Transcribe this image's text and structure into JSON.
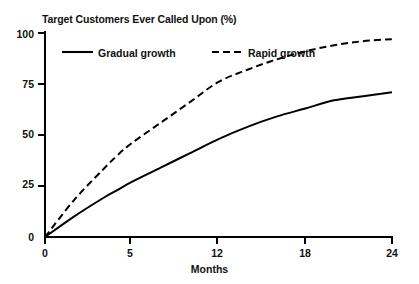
{
  "chart_data": {
    "type": "line",
    "title": "Target Customers Ever Called Upon (%)",
    "xlabel": "Months",
    "ylabel": "",
    "xlim": [
      0,
      24
    ],
    "ylim": [
      0,
      100
    ],
    "grid": false,
    "legend_position": "upper-left-inside",
    "xticks": [
      0,
      5,
      12,
      18,
      24
    ],
    "xtick_labels": [
      "0",
      "5",
      "12",
      "18",
      "24"
    ],
    "yticks": [
      0,
      25,
      50,
      75,
      100
    ],
    "ytick_labels": [
      "0",
      "25",
      "50",
      "75",
      "100"
    ],
    "x": [
      0,
      2,
      4,
      5,
      6,
      8,
      10,
      12,
      14,
      16,
      18,
      20,
      22,
      24
    ],
    "series": [
      {
        "name": "Gradual growth",
        "style": "solid",
        "color": "#000000",
        "values": [
          0,
          10,
          19,
          23,
          27,
          34,
          41,
          48,
          54,
          59,
          63,
          67,
          69,
          71
        ]
      },
      {
        "name": "Rapid growth",
        "style": "dashed",
        "color": "#000000",
        "values": [
          0,
          18,
          33,
          40,
          46,
          56,
          66,
          76,
          82,
          87,
          91,
          94,
          96,
          97
        ]
      }
    ]
  },
  "legend": {
    "items": [
      {
        "label": "Gradual growth"
      },
      {
        "label": "Rapid growth"
      }
    ]
  }
}
